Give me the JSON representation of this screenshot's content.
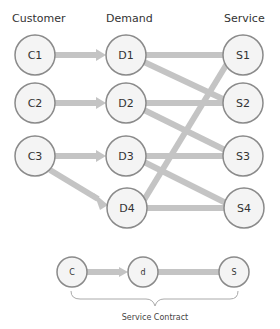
{
  "headers": {
    "customer": "Customer",
    "demand": "Demand",
    "service": "Service"
  },
  "nodes": {
    "customers": [
      "C1",
      "C2",
      "C3"
    ],
    "demands": [
      "D1",
      "D2",
      "D3",
      "D4"
    ],
    "services": [
      "S1",
      "S2",
      "S3",
      "S4"
    ]
  },
  "edges": [
    {
      "from": "C1",
      "to": "D1",
      "arrow": true
    },
    {
      "from": "C2",
      "to": "D2",
      "arrow": true
    },
    {
      "from": "C3",
      "to": "D3",
      "arrow": true
    },
    {
      "from": "C3",
      "to": "D4",
      "arrow": true
    },
    {
      "from": "D1",
      "to": "S1"
    },
    {
      "from": "D1",
      "to": "S2"
    },
    {
      "from": "D2",
      "to": "S2"
    },
    {
      "from": "D2",
      "to": "S3"
    },
    {
      "from": "D3",
      "to": "S3"
    },
    {
      "from": "D3",
      "to": "S4"
    },
    {
      "from": "D4",
      "to": "S4"
    },
    {
      "from": "D4",
      "to": "S1"
    }
  ],
  "legend": {
    "nodes": [
      "C",
      "d",
      "S"
    ],
    "caption": "Service Contract"
  },
  "colors": {
    "edge": "#c4c4c4",
    "node_fill": "#f4f4f4",
    "node_stroke": "#8a8a8a"
  }
}
